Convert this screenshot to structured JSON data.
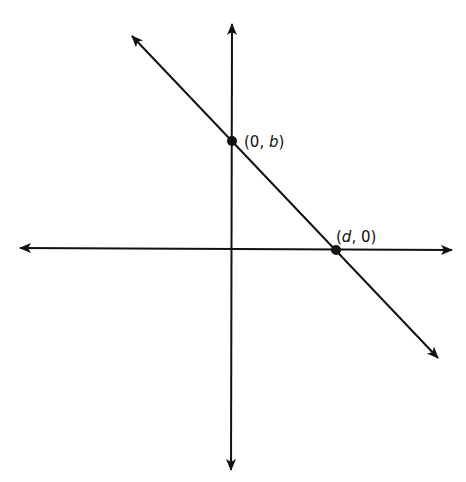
{
  "diagram": {
    "type": "coordinate-plane",
    "colors": {
      "stroke": "#111111",
      "background": "#ffffff"
    },
    "axes": {
      "x_axis": {
        "arrows": "both"
      },
      "y_axis": {
        "arrows": "both"
      }
    },
    "line": {
      "arrows": "both",
      "slope_sign": "negative"
    },
    "points": [
      {
        "id": "y-intercept",
        "label_open": "(0, ",
        "label_var": "b",
        "label_close": ")"
      },
      {
        "id": "x-intercept",
        "label_open": "(",
        "label_var": "d",
        "label_close": ", 0)"
      }
    ]
  }
}
